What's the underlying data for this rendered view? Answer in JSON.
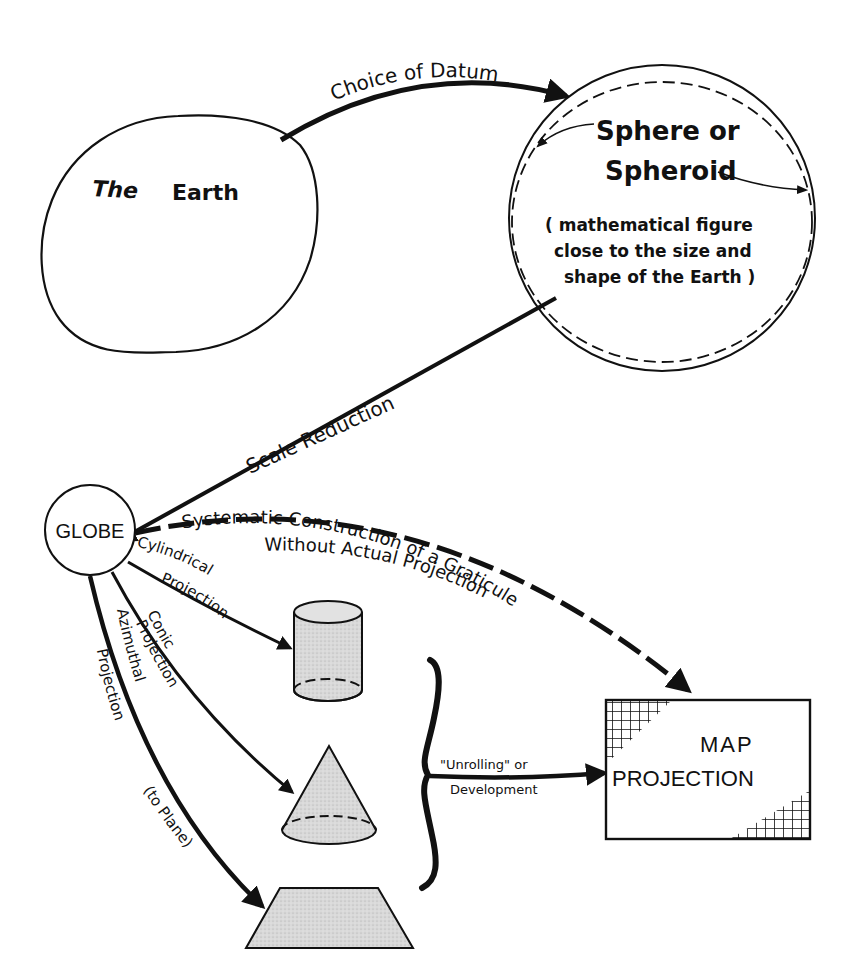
{
  "diagram": {
    "colors": {
      "ink": "#111111",
      "fill_gray": "#d6d6d6",
      "background": "#ffffff"
    },
    "nodes": {
      "earth": {
        "label_a": "The",
        "label_b": "Earth"
      },
      "sphere": {
        "title_1": "Sphere or",
        "title_2": "Spheroid",
        "desc_1": "( mathematical figure",
        "desc_2": "close to the size and",
        "desc_3": "shape of the Earth )"
      },
      "globe": {
        "label": "GLOBE"
      },
      "cylinder": {
        "shape": "cylinder"
      },
      "cone": {
        "shape": "cone"
      },
      "plane": {
        "shape": "plane"
      },
      "map": {
        "label_1": "MAP",
        "label_2": "PROJECTION"
      }
    },
    "edges": {
      "datum": {
        "label": "Choice of Datum"
      },
      "scale": {
        "label": "Scale Reduction"
      },
      "graticule": {
        "label_1": "Systematic Construction of a Graticule",
        "label_2": "Without Actual Projection"
      },
      "cylindrical": {
        "label_1": "Cylindrical",
        "label_2": "Projection"
      },
      "conic": {
        "label_1": "Conic",
        "label_2": "Projection"
      },
      "azimuthal": {
        "label_1": "Azimuthal",
        "label_2": "Projection",
        "label_3": "(to Plane)"
      },
      "unroll": {
        "label_1": "\"Unrolling\" or",
        "label_2": "Development"
      }
    }
  }
}
